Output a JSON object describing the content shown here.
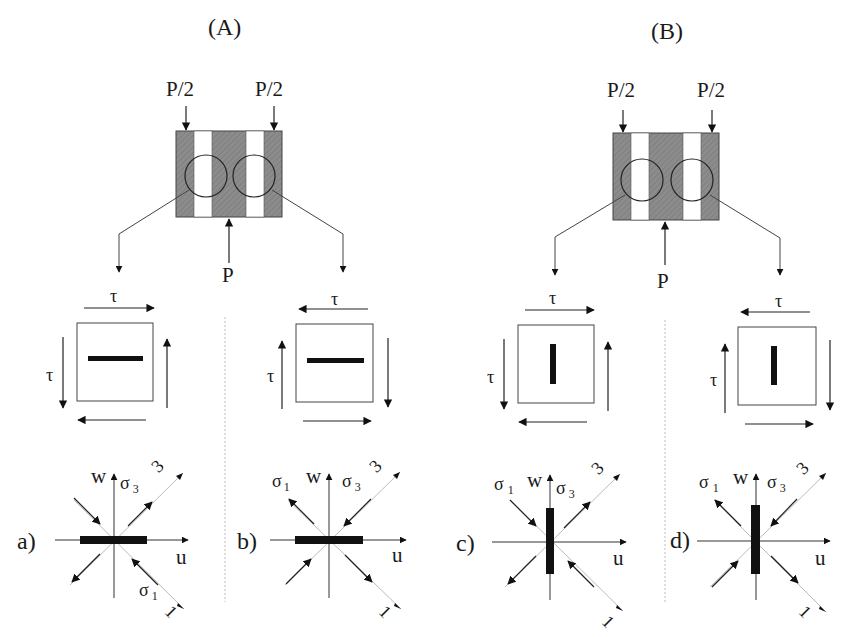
{
  "panels": [
    {
      "id": "A",
      "title": "(A)",
      "loads": {
        "top_left": "P/2",
        "top_right": "P/2",
        "bottom": "P"
      },
      "shear_elements": [
        {
          "label": "τ",
          "side_label": "τ",
          "crack": "horizontal",
          "top_arrow": "right",
          "left_arrow": "down",
          "right_arrow": "up",
          "bottom_arrow": "left"
        },
        {
          "label": "τ",
          "side_label": "τ",
          "crack": "horizontal",
          "top_arrow": "left",
          "left_arrow": "up",
          "right_arrow": "down",
          "bottom_arrow": "right"
        }
      ],
      "stress_diagrams": [
        {
          "case": "a)",
          "axis_w": "w",
          "axis_u": "u",
          "sigma1": "σ",
          "sigma1_sub": "1",
          "sigma3": "σ",
          "sigma3_sub": "3",
          "dir3": "3",
          "dir1": "1",
          "bar": "horizontal"
        },
        {
          "case": "b)",
          "axis_w": "w",
          "axis_u": "u",
          "sigma1": "σ",
          "sigma1_sub": "1",
          "sigma3": "σ",
          "sigma3_sub": "3",
          "dir3": "3",
          "dir1": "1",
          "bar": "horizontal"
        }
      ]
    },
    {
      "id": "B",
      "title": "(B)",
      "loads": {
        "top_left": "P/2",
        "top_right": "P/2",
        "bottom": "P"
      },
      "shear_elements": [
        {
          "label": "τ",
          "side_label": "τ",
          "crack": "vertical",
          "top_arrow": "right",
          "left_arrow": "down",
          "right_arrow": "up",
          "bottom_arrow": "left"
        },
        {
          "label": "τ",
          "side_label": "τ",
          "crack": "vertical",
          "top_arrow": "left",
          "left_arrow": "up",
          "right_arrow": "down",
          "bottom_arrow": "right"
        }
      ],
      "stress_diagrams": [
        {
          "case": "c)",
          "axis_w": "w",
          "axis_u": "u",
          "sigma1": "σ",
          "sigma1_sub": "1",
          "sigma3": "σ",
          "sigma3_sub": "3",
          "dir3": "3",
          "dir1": "1",
          "bar": "vertical"
        },
        {
          "case": "d)",
          "axis_w": "w",
          "axis_u": "u",
          "sigma1": "σ",
          "sigma1_sub": "1",
          "sigma3": "σ",
          "sigma3_sub": "3",
          "dir3": "3",
          "dir1": "1",
          "bar": "vertical"
        }
      ]
    }
  ],
  "colors": {
    "specimen_fill": "#8a8a8a",
    "strip_fill": "#ffffff",
    "line": "#222222",
    "crack": "#111111"
  }
}
